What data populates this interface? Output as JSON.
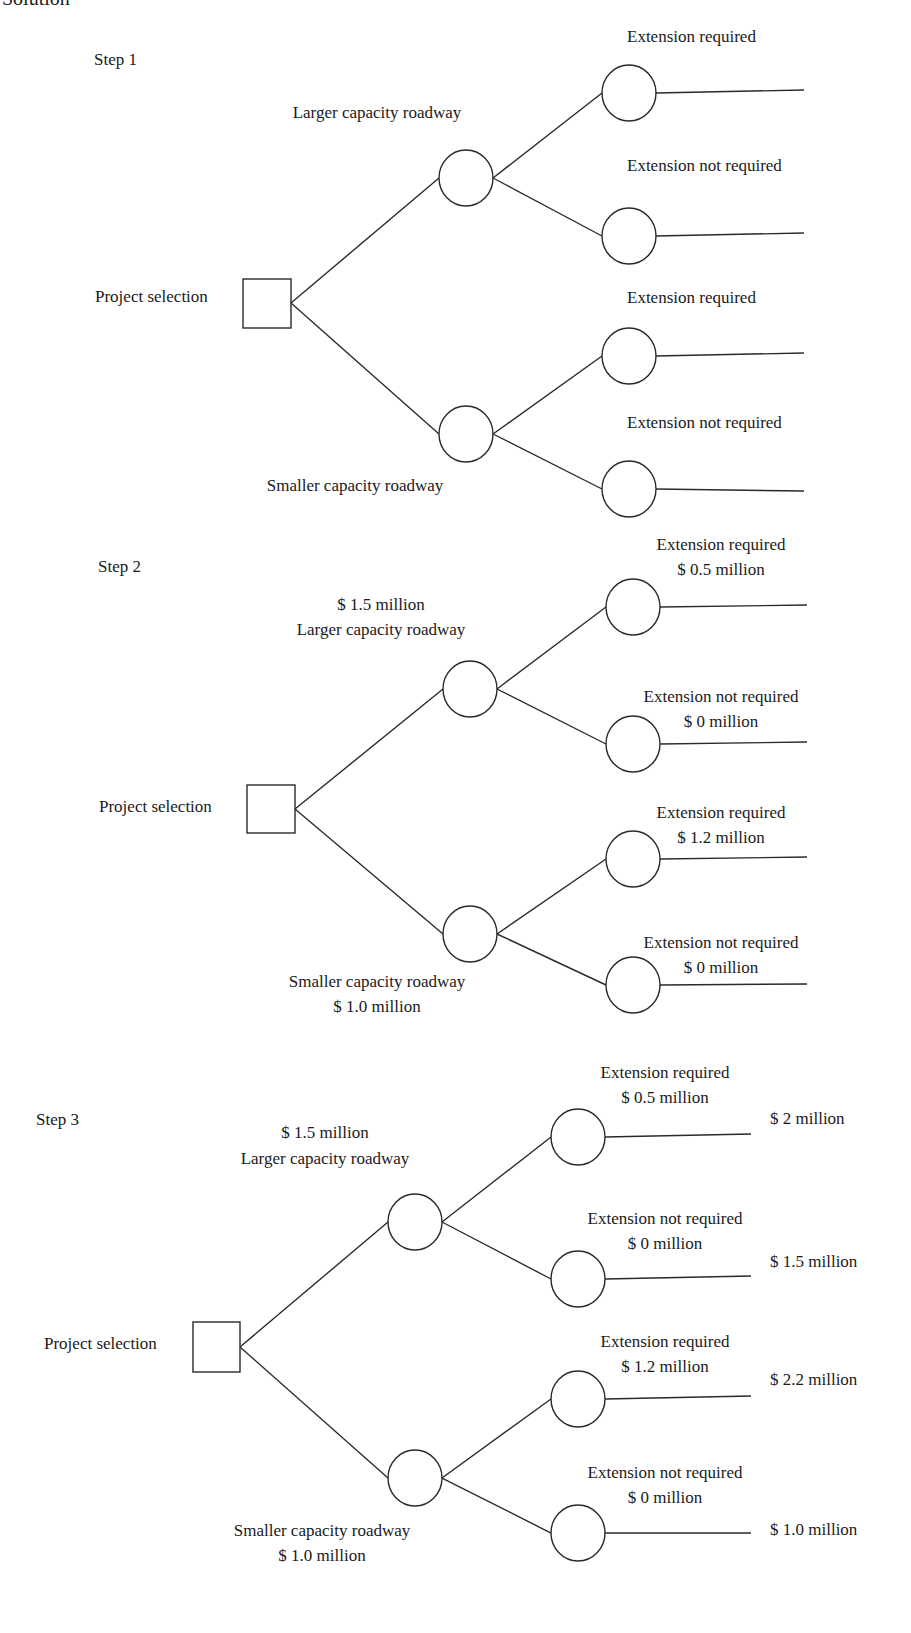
{
  "heading": "Solution",
  "steps": [
    {
      "label": "Step 1",
      "decision": "Project selection",
      "branches": {
        "larger": {
          "label": "Larger capacity roadway",
          "cost": ""
        },
        "smaller": {
          "label": "Smaller capacity roadway",
          "cost": ""
        }
      },
      "outcomes": [
        {
          "label": "Extension required",
          "cost": "",
          "payoff": ""
        },
        {
          "label": "Extension not required",
          "cost": "",
          "payoff": ""
        },
        {
          "label": "Extension required",
          "cost": "",
          "payoff": ""
        },
        {
          "label": "Extension not required",
          "cost": "",
          "payoff": ""
        }
      ]
    },
    {
      "label": "Step 2",
      "decision": "Project selection",
      "branches": {
        "larger": {
          "label": "Larger capacity roadway",
          "cost": "$ 1.5 million"
        },
        "smaller": {
          "label": "Smaller capacity roadway",
          "cost": "$ 1.0 million"
        }
      },
      "outcomes": [
        {
          "label": "Extension required",
          "cost": "$ 0.5 million",
          "payoff": ""
        },
        {
          "label": "Extension not required",
          "cost": "$ 0 million",
          "payoff": ""
        },
        {
          "label": "Extension required",
          "cost": "$ 1.2 million",
          "payoff": ""
        },
        {
          "label": "Extension not required",
          "cost": "$ 0 million",
          "payoff": ""
        }
      ]
    },
    {
      "label": "Step 3",
      "decision": "Project selection",
      "branches": {
        "larger": {
          "label": "Larger capacity roadway",
          "cost": "$ 1.5 million"
        },
        "smaller": {
          "label": "Smaller capacity roadway",
          "cost": "$ 1.0 million"
        }
      },
      "outcomes": [
        {
          "label": "Extension required",
          "cost": "$ 0.5 million",
          "payoff": "$ 2 million"
        },
        {
          "label": "Extension not required",
          "cost": "$ 0 million",
          "payoff": "$ 1.5 million"
        },
        {
          "label": "Extension required",
          "cost": "$ 1.2 million",
          "payoff": "$ 2.2 million"
        },
        {
          "label": "Extension not required",
          "cost": "$ 0 million",
          "payoff": "$ 1.0 million"
        }
      ]
    }
  ],
  "colors": {
    "stroke": "#2a2a2a",
    "text": "#1a1a1a",
    "background": "#ffffff"
  }
}
